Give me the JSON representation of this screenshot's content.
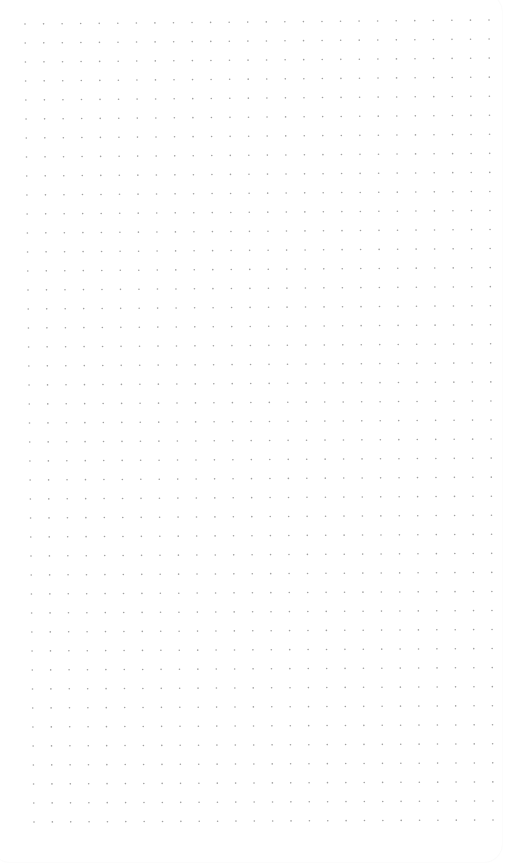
{
  "page": {
    "type": "dot-grid-paper",
    "background_color": "#ffffff",
    "dot_color": "#a0a0a0",
    "dot_radius": 0.8,
    "grid": {
      "columns": 26,
      "rows": 43,
      "corners": {
        "top_left": [
          25,
          24
        ],
        "top_right": [
          489,
          20
        ],
        "bottom_left": [
          34,
          822
        ],
        "bottom_right": [
          493,
          820
        ]
      }
    }
  }
}
